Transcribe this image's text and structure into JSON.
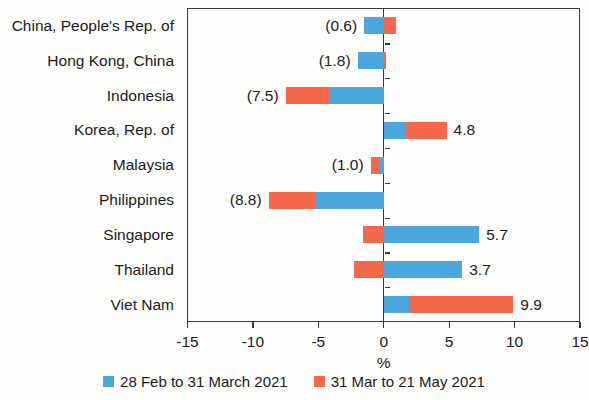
{
  "chart_data": {
    "type": "bar",
    "orientation": "horizontal",
    "stacked": true,
    "title": "",
    "xlabel": "%",
    "ylabel": "",
    "xlim": [
      -15,
      15
    ],
    "xticks": [
      -15,
      -10,
      -5,
      0,
      5,
      10,
      15
    ],
    "xticklabels": [
      "-15",
      "-10",
      "-5",
      "0",
      "5",
      "10",
      "15"
    ],
    "grid": false,
    "legend_position": "bottom",
    "categories": [
      "China, People's Rep. of",
      "Hong Kong, China",
      "Indonesia",
      "Korea, Rep. of",
      "Malaysia",
      "Philippines",
      "Singapore",
      "Thailand",
      "Viet Nam"
    ],
    "series": [
      {
        "name": "28 Feb to 31 March 2021",
        "color": "#4BA7DD",
        "values": [
          -1.5,
          -2.0,
          -4.2,
          1.6,
          -0.3,
          -5.2,
          7.3,
          6.0,
          1.9
        ]
      },
      {
        "name": "31 Mar to 21 May 2021",
        "color": "#F2694B",
        "values": [
          0.9,
          0.2,
          -3.3,
          3.2,
          -0.7,
          -3.6,
          -1.6,
          -2.3,
          8.0
        ]
      }
    ],
    "totals": [
      -0.6,
      -1.8,
      -7.5,
      4.8,
      -1.0,
      -8.8,
      5.7,
      3.7,
      9.9
    ],
    "total_labels": [
      "(0.6)",
      "(1.8)",
      "(7.5)",
      "4.8",
      "(1.0)",
      "(8.8)",
      "5.7",
      "3.7",
      "9.9"
    ]
  },
  "legend": {
    "items": [
      {
        "label": "28 Feb to 31 March 2021",
        "color": "#4BA7DD"
      },
      {
        "label": "31 Mar to 21 May 2021",
        "color": "#F2694B"
      }
    ]
  },
  "axis": {
    "x_title": "%"
  }
}
